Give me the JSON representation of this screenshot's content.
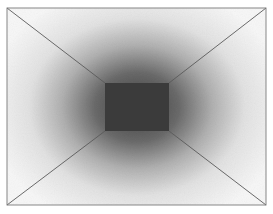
{
  "figure": {
    "canvas": {
      "width": 273,
      "height": 214,
      "background": "#ffffff"
    },
    "outer_frame": {
      "x1": 7,
      "y1": 8,
      "x2": 266,
      "y2": 205,
      "stroke": "#7a7a7a"
    },
    "back_wall": {
      "x1": 105,
      "y1": 83,
      "x2": 169,
      "y2": 131,
      "fill": "#3c3c3c"
    },
    "shading": {
      "center_x": 137,
      "center_y": 107,
      "inner_color": "#4a4a4a",
      "mid_color": "#9a9a9a",
      "outer_color": "#f4f4f4"
    },
    "diagonal_edges": [
      {
        "name": "top-left",
        "from": [
          7,
          8
        ],
        "to": [
          105,
          83
        ]
      },
      {
        "name": "top-right",
        "from": [
          266,
          8
        ],
        "to": [
          169,
          83
        ]
      },
      {
        "name": "bottom-left",
        "from": [
          7,
          205
        ],
        "to": [
          105,
          131
        ]
      },
      {
        "name": "bottom-right",
        "from": [
          266,
          205
        ],
        "to": [
          169,
          131
        ]
      }
    ],
    "edge_color": "#5a5a5a"
  }
}
